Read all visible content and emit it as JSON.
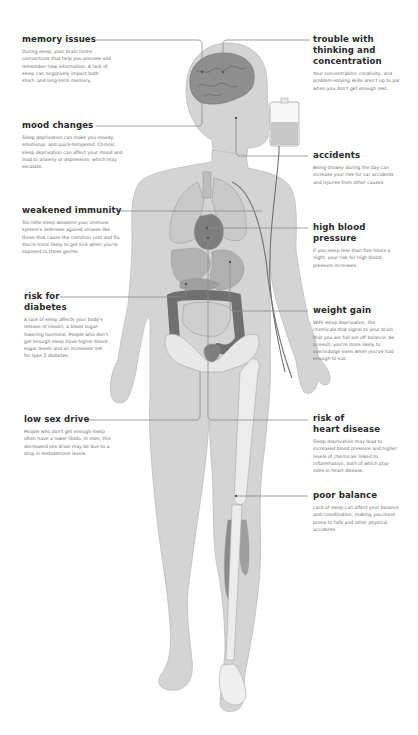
{
  "figure": {
    "topic": "effects of sleep deprivation on the body",
    "colors": {
      "skin": "#d4d4d4",
      "skin_outline": "#b9b9b9",
      "organ_light": "#c4c4c4",
      "organ_mid": "#a8a8a8",
      "organ_dark": "#6f6f6f",
      "leader_line": "#8a8a8a",
      "heading": "#2a2a2a",
      "body_text": "#6b6b6b"
    }
  },
  "callouts": {
    "memory": {
      "title": "memory issues",
      "text": "During sleep, your brain forms connections that help you process and remember new information. A lack of sleep can negatively impact both short- and long-term memory."
    },
    "mood": {
      "title": "mood changes",
      "text": "Sleep deprivation can make you moody, emotional, and quick-tempered. Chronic sleep deprivation can affect your mood and lead to anxiety or depression, which may escalate."
    },
    "immunity": {
      "title": "weakened immunity",
      "text": "Too little sleep weakens your immune system's defenses against viruses like those that cause the common cold and flu. You're more likely to get sick when you're exposed to these germs."
    },
    "diabetes": {
      "title_line1": "risk for",
      "title_line2": "diabetes",
      "text": "A lack of sleep affects your body's release of insulin, a blood sugar-lowering hormone. People who don't get enough sleep have higher blood sugar levels and an increased risk for type 2 diabetes."
    },
    "sexdrive": {
      "title": "low sex drive",
      "text": "People who don't get enough sleep often have a lower libido. In men, this decreased sex drive may be due to a drop in testosterone levels."
    },
    "thinking": {
      "title_line1": "trouble with",
      "title_line2": "thinking and",
      "title_line3": "concentration",
      "text": "Your concentration, creativity, and problem-solving skills aren't up to par when you don't get enough rest."
    },
    "accidents": {
      "title": "accidents",
      "text": "Being drowsy during the day can increase your risk for car accidents and injuries from other causes."
    },
    "bloodpressure": {
      "title_line1": "high blood",
      "title_line2": "pressure",
      "text": "If you sleep less than five hours a night, your risk for high blood pressure increases."
    },
    "weight": {
      "title": "weight gain",
      "text": "With sleep deprivation, the chemicals that signal to your brain that you are full are off balance. As a result, you're more likely to overindulge even when you've had enough to eat."
    },
    "heart": {
      "title_line1": "risk of",
      "title_line2": "heart disease",
      "text": "Sleep deprivation may lead to increased blood pressure and higher levels of chemicals linked to inflammation, both of which play roles in heart disease."
    },
    "balance": {
      "title": "poor balance",
      "text": "Lack of sleep can affect your balance and coordination, making you more prone to falls and other physical accidents."
    }
  }
}
